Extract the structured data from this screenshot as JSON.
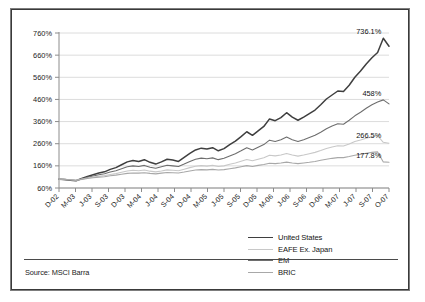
{
  "source_note": "Source: MSCI Barra",
  "legend": {
    "position": "bottom-right",
    "items": [
      {
        "label": "United States",
        "color": "#3f3f3f"
      },
      {
        "label": "EAFE Ex. Japan",
        "color": "#c8c8c8"
      },
      {
        "label": "EM",
        "color": "#6e6e6e"
      },
      {
        "label": "BRIC",
        "color": "#a8a8a8"
      }
    ]
  },
  "chart_data": {
    "type": "line",
    "title": "",
    "subtitle": "",
    "xlabel": "",
    "ylabel": "",
    "grid": true,
    "legend_position": "bottom-right",
    "ylim": [
      60,
      760
    ],
    "yticks": [
      "60%",
      "160%",
      "260%",
      "360%",
      "460%",
      "560%",
      "660%",
      "760%"
    ],
    "ytick_values": [
      60,
      160,
      260,
      360,
      460,
      560,
      660,
      760
    ],
    "xticks": [
      "D-02",
      "M-03",
      "J-03",
      "S-03",
      "D-03",
      "M-04",
      "J-04",
      "S-04",
      "D-04",
      "M-05",
      "J-05",
      "S-05",
      "D-05",
      "M-06",
      "J-06",
      "S-06",
      "D-06",
      "M-07",
      "J-07",
      "S-07",
      "O-07"
    ],
    "annotations": [
      {
        "text": "736.1%",
        "series": "BRIC",
        "x": "S-07"
      },
      {
        "text": "458%",
        "series": "EM",
        "x": "S-07"
      },
      {
        "text": "266.5%",
        "series": "EAFE Ex. Japan",
        "x": "S-07"
      },
      {
        "text": "177.8%",
        "series": "United States",
        "x": "S-07"
      }
    ],
    "x": [
      "D-02",
      "J-03",
      "F-03",
      "M-03",
      "A-03",
      "M-03b",
      "J-03",
      "J-03b",
      "A-03",
      "S-03",
      "O-03",
      "N-03",
      "D-03",
      "J-04",
      "F-04",
      "M-04",
      "A-04",
      "M-04b",
      "J-04",
      "J-04b",
      "A-04",
      "S-04",
      "O-04",
      "N-04",
      "D-04",
      "J-05",
      "F-05",
      "M-05",
      "A-05",
      "M-05b",
      "J-05",
      "J-05b",
      "A-05",
      "S-05",
      "O-05",
      "N-05",
      "D-05",
      "J-06",
      "F-06",
      "M-06",
      "A-06",
      "M-06b",
      "J-06",
      "J-06b",
      "A-06",
      "S-06",
      "O-06",
      "N-06",
      "D-06",
      "J-07",
      "F-07",
      "M-07",
      "A-07",
      "M-07b",
      "J-07",
      "J-07b",
      "A-07",
      "S-07",
      "O-07"
    ],
    "series": [
      {
        "name": "BRIC",
        "color": "#3f3f3f",
        "end_value": 736.1,
        "values": [
          100,
          98,
          95,
          93,
          103,
          112,
          120,
          128,
          133,
          144,
          152,
          165,
          178,
          184,
          180,
          188,
          176,
          168,
          178,
          190,
          186,
          180,
          198,
          216,
          232,
          240,
          236,
          242,
          228,
          238,
          256,
          272,
          292,
          314,
          298,
          318,
          338,
          372,
          364,
          378,
          400,
          380,
          366,
          380,
          396,
          412,
          436,
          462,
          480,
          498,
          496,
          524,
          560,
          588,
          620,
          648,
          672,
          736.1,
          700
        ]
      },
      {
        "name": "EM",
        "color": "#6e6e6e",
        "end_value": 458,
        "values": [
          100,
          98,
          96,
          94,
          101,
          108,
          114,
          120,
          124,
          132,
          138,
          147,
          156,
          160,
          157,
          162,
          154,
          149,
          156,
          163,
          160,
          157,
          168,
          180,
          190,
          195,
          192,
          196,
          188,
          194,
          205,
          215,
          228,
          242,
          232,
          244,
          256,
          276,
          270,
          278,
          290,
          278,
          270,
          278,
          288,
          298,
          312,
          328,
          340,
          350,
          348,
          366,
          386,
          402,
          420,
          436,
          448,
          458,
          440
        ]
      },
      {
        "name": "EAFE Ex. Japan",
        "color": "#c8c8c8",
        "end_value": 266.5,
        "values": [
          100,
          99,
          97,
          95,
          100,
          105,
          109,
          113,
          116,
          121,
          125,
          131,
          137,
          140,
          138,
          141,
          136,
          133,
          137,
          142,
          140,
          138,
          145,
          152,
          158,
          161,
          159,
          162,
          157,
          160,
          167,
          173,
          181,
          189,
          183,
          190,
          197,
          208,
          205,
          209,
          216,
          209,
          204,
          209,
          215,
          221,
          229,
          238,
          245,
          251,
          250,
          259,
          270,
          277,
          285,
          292,
          296,
          266.5,
          262
        ]
      },
      {
        "name": "United States",
        "color": "#a8a8a8",
        "end_value": 177.8,
        "values": [
          100,
          99,
          97,
          95,
          99,
          103,
          106,
          109,
          111,
          115,
          118,
          122,
          126,
          128,
          127,
          129,
          126,
          124,
          127,
          130,
          129,
          128,
          132,
          137,
          141,
          143,
          142,
          144,
          141,
          143,
          147,
          151,
          156,
          161,
          157,
          162,
          166,
          172,
          170,
          173,
          177,
          173,
          170,
          173,
          176,
          180,
          185,
          190,
          194,
          197,
          197,
          202,
          208,
          212,
          217,
          221,
          223,
          177.8,
          176
        ]
      }
    ]
  }
}
